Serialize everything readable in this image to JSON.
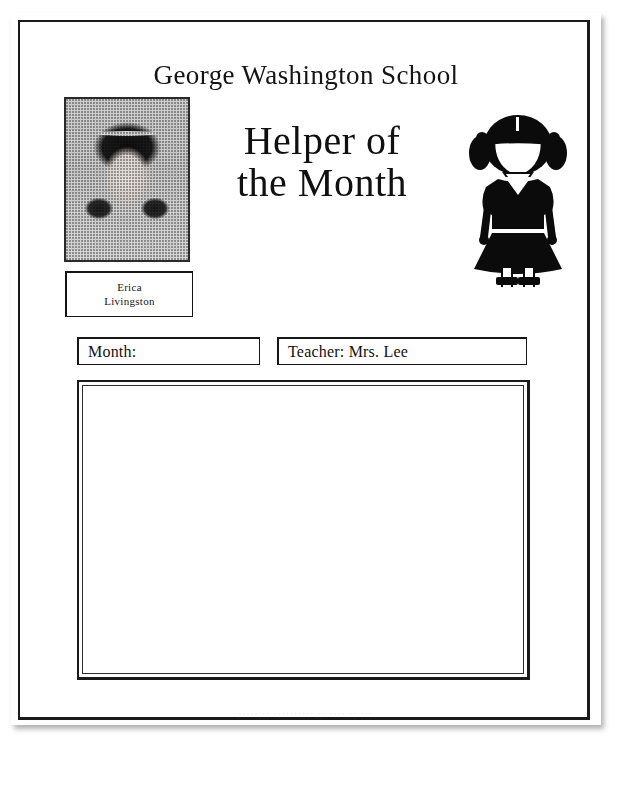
{
  "document": {
    "school_title": "George Washington School",
    "heading_line1": "Helper of",
    "heading_line2": "the Month",
    "footer_credit": "•••••  ••  ••••••••••   •• ••••.•• •••"
  },
  "photo": {
    "alt_name": "student-portrait-photo"
  },
  "clipart": {
    "alt_name": "girl-silhouette-clipart"
  },
  "name_box": {
    "first_name": "Erica",
    "last_name": "Livingston"
  },
  "fields": [
    {
      "name": "month",
      "label": "Month:",
      "value": ""
    },
    {
      "name": "teacher",
      "label": "Teacher: Mrs. Lee",
      "value": "Mrs. Lee"
    }
  ],
  "field_text": {
    "month": "Month:",
    "teacher": "Teacher: Mrs. Lee"
  },
  "content_area": {
    "value": ""
  },
  "colors": {
    "ink": "#141414",
    "paper": "#ffffff",
    "rule": "#1a1a1a",
    "faint": "#f4f4f4"
  }
}
